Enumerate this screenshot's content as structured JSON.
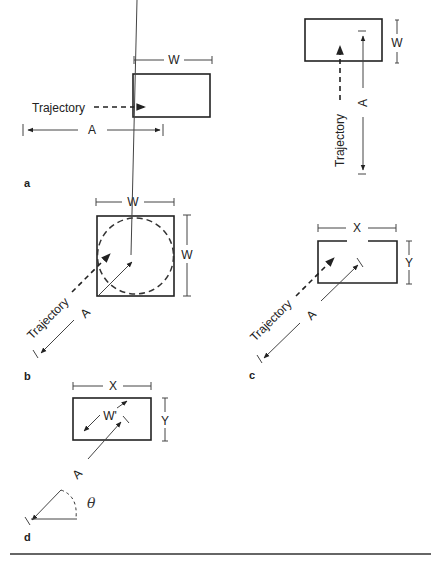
{
  "figure": {
    "panels": {
      "a": {
        "label": "a",
        "width_label": "W",
        "trajectory_label": "Trajectory",
        "amplitude_label": "A"
      },
      "a2": {
        "width_label": "W",
        "trajectory_label": "Trajectory",
        "amplitude_label": "A"
      },
      "b": {
        "label": "b",
        "width_label_top": "W",
        "width_label_side": "W",
        "trajectory_label": "Trajectory",
        "amplitude_label": "A"
      },
      "c": {
        "label": "c",
        "x_label": "X",
        "y_label": "Y",
        "trajectory_label": "Trajectory",
        "amplitude_label": "A"
      },
      "d": {
        "label": "d",
        "x_label": "X",
        "y_label": "Y",
        "effective_width_label": "W'",
        "amplitude_label": "A",
        "angle_label": "θ"
      }
    }
  }
}
